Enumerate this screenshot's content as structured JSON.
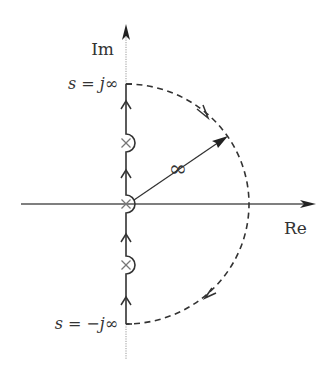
{
  "diagram": {
    "axes": {
      "imag_label": "Im",
      "real_label": "Re"
    },
    "labels": {
      "top": {
        "lhs": "s",
        "eq": "=",
        "rhs": "j∞"
      },
      "bottom": {
        "lhs": "s",
        "eq": "=",
        "rhs": "−j∞"
      },
      "radius": "∞"
    },
    "poles": [
      {
        "name": "pole-upper",
        "symbol": "×",
        "y_px": 143
      },
      {
        "name": "pole-origin",
        "symbol": "×",
        "y_px": 204
      },
      {
        "name": "pole-lower",
        "symbol": "×",
        "y_px": 265
      }
    ],
    "colors": {
      "line": "#333333",
      "axis": "#555555",
      "dotted": "#999999",
      "background": "#ffffff"
    }
  }
}
